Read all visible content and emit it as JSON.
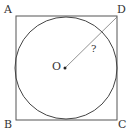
{
  "diagram": {
    "type": "geometry",
    "labels": {
      "A": "A",
      "B": "B",
      "C": "C",
      "D": "D",
      "O": "O",
      "unknown": "?"
    },
    "colors": {
      "stroke": "#444444",
      "center_dot": "#222222"
    }
  }
}
